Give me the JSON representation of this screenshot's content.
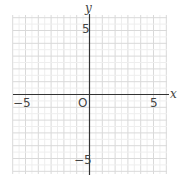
{
  "chart_data": {
    "type": "scatter",
    "title": "",
    "xlabel": "x",
    "ylabel": "y",
    "xlim": [
      -6,
      6
    ],
    "ylim": [
      -6,
      6
    ],
    "grid": true,
    "grid_step": 1,
    "x_ticks": [
      {
        "value": -5,
        "label": "−5"
      },
      {
        "value": 5,
        "label": "5"
      }
    ],
    "y_ticks": [
      {
        "value": 5,
        "label": "5"
      },
      {
        "value": -5,
        "label": "−5"
      }
    ],
    "origin_label": "O",
    "points": []
  },
  "colors": {
    "grid": "#d9d9d9",
    "axis": "#333333",
    "text": "#444444"
  }
}
